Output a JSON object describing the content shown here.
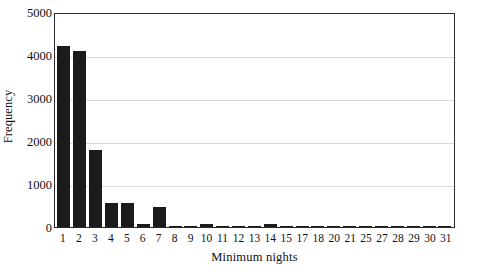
{
  "chart_data": {
    "type": "bar",
    "title": "",
    "xlabel": "Minimum nights",
    "ylabel": "Frequency",
    "categories": [
      "1",
      "2",
      "3",
      "4",
      "5",
      "6",
      "7",
      "8",
      "9",
      "10",
      "11",
      "12",
      "13",
      "14",
      "15",
      "17",
      "18",
      "20",
      "21",
      "25",
      "27",
      "28",
      "29",
      "30",
      "31"
    ],
    "values": [
      4210,
      4090,
      1790,
      560,
      555,
      75,
      465,
      8,
      6,
      80,
      8,
      6,
      6,
      60,
      5,
      4,
      4,
      3,
      3,
      3,
      3,
      3,
      3,
      3,
      3
    ],
    "ylim": [
      0,
      5000
    ],
    "yticks": [
      0,
      1000,
      2000,
      3000,
      4000,
      5000
    ],
    "ytick_labels": [
      "0",
      "1000",
      "2000",
      "3000",
      "4000",
      "5000"
    ],
    "grid": "horizontal",
    "legend": "none",
    "bar_color": "#1b1b1b",
    "grid_color": "#d9d9d9",
    "axis_color": "#2a2a2a"
  }
}
